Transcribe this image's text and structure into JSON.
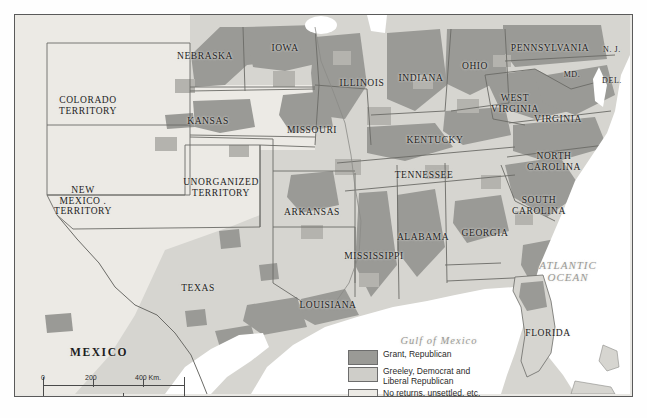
{
  "map": {
    "title": "United States Presidential Election 1872",
    "frame": {
      "x": 14,
      "y": 14,
      "width": 617,
      "height": 381
    },
    "background_color": "#e9e8e4"
  },
  "colors": {
    "grant_republican": "#9a9a96",
    "greeley_democrat": "#cfcec9",
    "no_returns": "#eceae5",
    "water": "#ffffff",
    "border": "#5a5a5a",
    "state_line": "#6b6b67",
    "label_text": "#1d1d1d",
    "water_text": "#9a9a96"
  },
  "labels": {
    "states": [
      {
        "name": "NEBRASKA",
        "text": "NEBRASKA",
        "x": 190,
        "y": 36,
        "size": "st"
      },
      {
        "name": "IOWA",
        "text": "IOWA",
        "x": 270,
        "y": 28,
        "size": "st"
      },
      {
        "name": "ILLINOIS",
        "text": "ILLINOIS",
        "x": 347,
        "y": 63,
        "size": "st"
      },
      {
        "name": "INDIANA",
        "text": "INDIANA",
        "x": 406,
        "y": 58,
        "size": "st"
      },
      {
        "name": "OHIO",
        "text": "OHIO",
        "x": 460,
        "y": 46,
        "size": "st"
      },
      {
        "name": "PENNSYLVANIA",
        "text": "PENNSYLVANIA",
        "x": 535,
        "y": 28,
        "size": "st"
      },
      {
        "name": "NEW JERSEY",
        "text": "N. J.",
        "x": 597,
        "y": 31,
        "size": "st-sm"
      },
      {
        "name": "MARYLAND",
        "text": "MD.",
        "x": 557,
        "y": 56,
        "size": "st-sm"
      },
      {
        "name": "DELAWARE",
        "text": "DEL.",
        "x": 597,
        "y": 62,
        "size": "st-sm"
      },
      {
        "name": "WEST VIRGINIA",
        "text": "WEST\nVIRGINIA",
        "x": 500,
        "y": 78,
        "size": "st"
      },
      {
        "name": "VIRGINIA",
        "text": "VIRGINIA",
        "x": 543,
        "y": 99,
        "size": "st"
      },
      {
        "name": "KANSAS",
        "text": "KANSAS",
        "x": 193,
        "y": 101,
        "size": "st"
      },
      {
        "name": "COLORADO TERRITORY",
        "text": "COLORADO\nTERRITORY",
        "x": 73,
        "y": 80,
        "size": "st"
      },
      {
        "name": "MISSOURI",
        "text": "MISSOURI",
        "x": 297,
        "y": 110,
        "size": "st"
      },
      {
        "name": "KENTUCKY",
        "text": "KENTUCKY",
        "x": 420,
        "y": 120,
        "size": "st"
      },
      {
        "name": "NORTH CAROLINA",
        "text": "NORTH\nCAROLINA",
        "x": 539,
        "y": 136,
        "size": "st"
      },
      {
        "name": "TENNESSEE",
        "text": "TENNESSEE",
        "x": 409,
        "y": 155,
        "size": "st"
      },
      {
        "name": "UNORGANIZED TERRITORY",
        "text": "UNORGANIZED\nTERRITORY",
        "x": 206,
        "y": 162,
        "size": "st"
      },
      {
        "name": "SOUTH CAROLINA",
        "text": "SOUTH\nCAROLINA",
        "x": 524,
        "y": 180,
        "size": "st"
      },
      {
        "name": "NEW MEXICO TERRITORY",
        "text": "NEW\nMEXICO .\nTERRITORY",
        "x": 68,
        "y": 170,
        "size": "st"
      },
      {
        "name": "ARKANSAS",
        "text": "ARKANSAS",
        "x": 297,
        "y": 192,
        "size": "st"
      },
      {
        "name": "ALABAMA",
        "text": "ALABAMA",
        "x": 408,
        "y": 217,
        "size": "st"
      },
      {
        "name": "GEORGIA",
        "text": "GEORGIA",
        "x": 470,
        "y": 213,
        "size": "st"
      },
      {
        "name": "MISSISSIPPI",
        "text": "MISSISSIPPI",
        "x": 359,
        "y": 236,
        "size": "st"
      },
      {
        "name": "TEXAS",
        "text": "TEXAS",
        "x": 183,
        "y": 268,
        "size": "st"
      },
      {
        "name": "LOUISIANA",
        "text": "LOUISIANA",
        "x": 313,
        "y": 285,
        "size": "st"
      },
      {
        "name": "FLORIDA",
        "text": "FLORIDA",
        "x": 533,
        "y": 313,
        "size": "st"
      }
    ],
    "countries": [
      {
        "name": "MEXICO",
        "text": "MEXICO",
        "x": 84,
        "y": 331
      }
    ],
    "water": [
      {
        "name": "ATLANTIC OCEAN",
        "text": "ATLANTIC\nOCEAN",
        "x": 553,
        "y": 244,
        "size": "ocean"
      },
      {
        "name": "GULF OF MEXICO",
        "text": "Gulf of Mexico",
        "x": 424,
        "y": 320,
        "size": "gulf"
      }
    ]
  },
  "legend": {
    "entries": [
      {
        "key": "grant",
        "label": "Grant, Republican",
        "color": "#9a9a96"
      },
      {
        "key": "greeley",
        "label": "Greeley, Democrat and\nLiberal Republican",
        "color": "#cfcec9"
      },
      {
        "key": "none",
        "label": "No returns, unsettled, etc.",
        "color": "#eceae5"
      }
    ]
  },
  "scale_bar": {
    "km": {
      "unit": "Km.",
      "ticks": [
        "0",
        "200",
        "400"
      ]
    },
    "mi": {
      "unit": "Mi.",
      "ticks": [
        "0",
        "200",
        "400"
      ]
    }
  }
}
